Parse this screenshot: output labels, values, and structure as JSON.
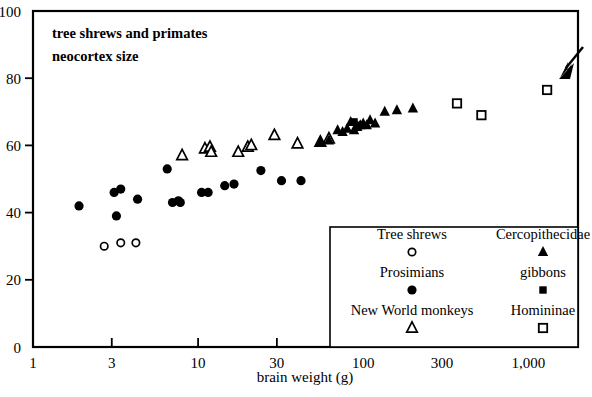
{
  "chart_data": {
    "type": "scatter",
    "title": [
      "tree shrews and primates",
      "neocortex size"
    ],
    "xlabel": "brain weight (g)",
    "ylabel": "",
    "xscale": "log",
    "xlim": [
      1,
      2000
    ],
    "ylim": [
      0,
      100
    ],
    "grid": false,
    "xticks": [
      {
        "value": 1,
        "label": "1"
      },
      {
        "value": 3,
        "label": "3"
      },
      {
        "value": 10,
        "label": "10"
      },
      {
        "value": 30,
        "label": "30"
      },
      {
        "value": 100,
        "label": "100"
      },
      {
        "value": 300,
        "label": "300"
      },
      {
        "value": 1000,
        "label": "1,000"
      }
    ],
    "yticks": [
      {
        "value": 0,
        "label": "0"
      },
      {
        "value": 20,
        "label": "20"
      },
      {
        "value": 40,
        "label": "40"
      },
      {
        "value": 60,
        "label": "60"
      },
      {
        "value": 80,
        "label": "80"
      },
      {
        "value": 100,
        "label": "100"
      }
    ],
    "legend_position": "bottom-right",
    "annotation": {
      "name": "arrow",
      "points_to": "Homininae (human) data point",
      "target": [
        1300,
        76
      ]
    },
    "series": [
      {
        "name": "Tree shrews",
        "marker": "open-circle",
        "color": "#000000",
        "points": [
          [
            2.7,
            30
          ],
          [
            3.4,
            31
          ],
          [
            4.2,
            31
          ]
        ]
      },
      {
        "name": "Prosimians",
        "marker": "filled-circle",
        "color": "#000000",
        "points": [
          [
            1.9,
            42
          ],
          [
            3.1,
            46
          ],
          [
            3.2,
            39
          ],
          [
            3.4,
            47
          ],
          [
            4.3,
            44
          ],
          [
            6.5,
            53
          ],
          [
            7.0,
            43
          ],
          [
            7.6,
            43.5
          ],
          [
            7.8,
            43
          ],
          [
            10.5,
            46
          ],
          [
            11.5,
            46
          ],
          [
            14.5,
            48
          ],
          [
            16.5,
            48.5
          ],
          [
            24,
            52.5
          ],
          [
            32,
            49.5
          ],
          [
            42,
            49.5
          ]
        ]
      },
      {
        "name": "New World monkeys",
        "marker": "open-triangle",
        "color": "#000000",
        "points": [
          [
            8.0,
            57
          ],
          [
            11.0,
            59
          ],
          [
            11.8,
            59.5
          ],
          [
            12.0,
            58
          ],
          [
            17.5,
            58
          ],
          [
            20,
            59.5
          ],
          [
            21,
            60
          ],
          [
            29,
            63
          ],
          [
            40,
            60.5
          ],
          [
            55,
            61
          ],
          [
            62,
            62
          ]
        ]
      },
      {
        "name": "Cercopithecidae",
        "marker": "filled-triangle",
        "color": "#000000",
        "points": [
          [
            55,
            61
          ],
          [
            62,
            61.5
          ],
          [
            70,
            64.5
          ],
          [
            75,
            64
          ],
          [
            80,
            65
          ],
          [
            84,
            67
          ],
          [
            88,
            64.5
          ],
          [
            92,
            65.5
          ],
          [
            96,
            66
          ],
          [
            100,
            66.5
          ],
          [
            105,
            66
          ],
          [
            110,
            67.5
          ],
          [
            118,
            66.5
          ],
          [
            135,
            70
          ],
          [
            160,
            70.5
          ],
          [
            200,
            71
          ]
        ]
      },
      {
        "name": "gibbons",
        "marker": "filled-square",
        "color": "#000000",
        "points": [
          [
            88,
            67
          ],
          [
            96,
            66
          ]
        ]
      },
      {
        "name": "Homininae",
        "marker": "open-square",
        "color": "#000000",
        "points": [
          [
            370,
            72.5
          ],
          [
            520,
            69
          ],
          [
            1300,
            76.5
          ]
        ]
      }
    ]
  },
  "legend": {
    "entries": [
      {
        "label": "Tree shrews",
        "marker": "open-circle"
      },
      {
        "label": "Cercopithecidae",
        "marker": "filled-triangle"
      },
      {
        "label": "Prosimians",
        "marker": "filled-circle"
      },
      {
        "label": "gibbons",
        "marker": "filled-square"
      },
      {
        "label": "New World monkeys",
        "marker": "open-triangle"
      },
      {
        "label": "Homininae",
        "marker": "open-square"
      }
    ]
  }
}
